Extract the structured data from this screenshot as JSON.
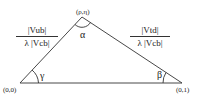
{
  "diagram": {
    "type": "unitarity-triangle",
    "colors": {
      "line": "#333333",
      "text": "#222222",
      "background": "#ffffff"
    },
    "vertices": {
      "apex": {
        "label": "(ρ,η)"
      },
      "left": {
        "label": "(0,0)"
      },
      "right": {
        "label": "(0,1)"
      }
    },
    "angles": {
      "apex": "α",
      "left": "γ",
      "right": "β"
    },
    "sides": {
      "left": {
        "numerator": "|Vub|",
        "denominator": "λ |Vcb|"
      },
      "right": {
        "numerator": "|Vtd|",
        "denominator": "λ |Vcb|"
      }
    }
  }
}
